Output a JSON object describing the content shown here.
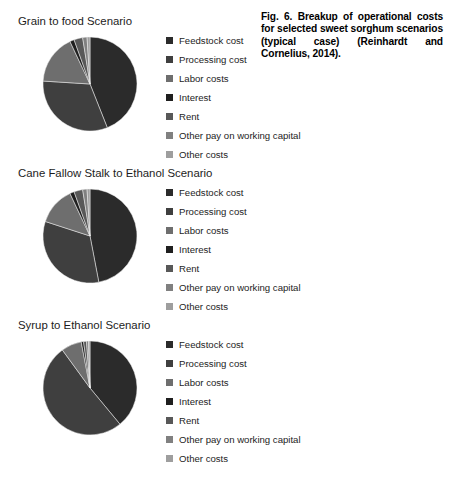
{
  "caption": {
    "text": "Fig. 6. Breakup of operational costs for selected sweet sorghum scenarios (typical case) (Reinhardt and Cornelius, 2014)."
  },
  "palette": {
    "feedstock_cost": "#2b2b2b",
    "processing_cost": "#3f3f3f",
    "labor_costs": "#6e6e6e",
    "interest": "#1f1f1f",
    "rent": "#585858",
    "other_pay_on_working_capital": "#808080",
    "other_costs": "#9e9e9e",
    "text": "#1c1c1c"
  },
  "legend_labels": [
    "Feedstock cost",
    "Processing cost",
    "Labor costs",
    "Interest",
    "Rent",
    "Other pay on working capital",
    "Other costs"
  ],
  "chart_data": [
    {
      "type": "pie",
      "title": "Grain to food Scenario",
      "categories": [
        "Feedstock cost",
        "Processing cost",
        "Labor costs",
        "Interest",
        "Rent",
        "Other pay on working capital",
        "Other costs"
      ],
      "values": [
        44,
        32,
        17,
        1.5,
        3,
        1.5,
        1
      ],
      "unit": "percent",
      "legend_position": "right",
      "start_angle_deg": 0,
      "direction": "clockwise"
    },
    {
      "type": "pie",
      "title": "Cane Fallow Stalk to Ethanol Scenario",
      "categories": [
        "Feedstock cost",
        "Processing cost",
        "Labor costs",
        "Interest",
        "Rent",
        "Other pay on working capital",
        "Other costs"
      ],
      "values": [
        47,
        33,
        13,
        1.5,
        3,
        1.5,
        1
      ],
      "unit": "percent",
      "legend_position": "right",
      "start_angle_deg": 0,
      "direction": "clockwise"
    },
    {
      "type": "pie",
      "title": "Syrup to Ethanol Scenario",
      "categories": [
        "Feedstock cost",
        "Processing cost",
        "Labor costs",
        "Interest",
        "Rent",
        "Other pay on working capital",
        "Other costs"
      ],
      "values": [
        39,
        51,
        7,
        0.8,
        1,
        0.7,
        0.5
      ],
      "unit": "percent",
      "legend_position": "right",
      "start_angle_deg": 0,
      "direction": "clockwise"
    }
  ]
}
